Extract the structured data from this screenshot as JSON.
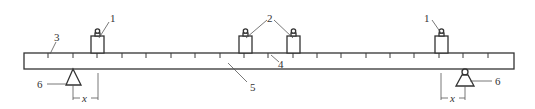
{
  "diagram": {
    "type": "beam-balance-schematic",
    "colors": {
      "line": "#3a3a3a",
      "background": "#ffffff"
    },
    "beam": {
      "x": 24,
      "y": 53,
      "width": 490,
      "height": 16
    },
    "ticks": {
      "start": 48,
      "spacing": 24.4,
      "count": 19,
      "length": 5
    },
    "labels": {
      "weight_left": "1",
      "weight_right": "1",
      "weights_middle": "2",
      "scale": "3",
      "scale_mark": "4",
      "beam": "5",
      "support_left": "6",
      "support_right": "6",
      "offset_left": "x",
      "offset_right": "x"
    },
    "components": [
      {
        "id": "1",
        "name": "weight"
      },
      {
        "id": "2",
        "name": "weights (pair)"
      },
      {
        "id": "3",
        "name": "scale ticks"
      },
      {
        "id": "4",
        "name": "scale mark"
      },
      {
        "id": "5",
        "name": "beam"
      },
      {
        "id": "6",
        "name": "support"
      }
    ]
  }
}
